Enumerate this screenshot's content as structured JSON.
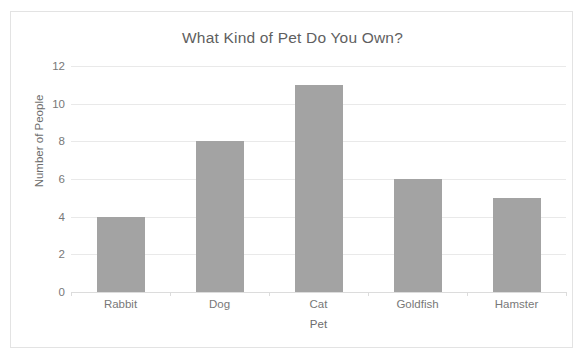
{
  "chart_data": {
    "type": "bar",
    "title": "What Kind of Pet Do You Own?",
    "xlabel": "Pet",
    "ylabel": "Number of People",
    "categories": [
      "Rabbit",
      "Dog",
      "Cat",
      "Goldfish",
      "Hamster"
    ],
    "values": [
      4,
      8,
      11,
      6,
      5
    ],
    "ylim": [
      0,
      12
    ],
    "yticks": [
      0,
      2,
      4,
      6,
      8,
      10,
      12
    ],
    "ytick_labels": [
      "0",
      "2",
      "4",
      "6",
      "8",
      "10",
      "12"
    ],
    "grid": true,
    "legend": false,
    "bar_color": "#a3a3a3",
    "gridline_color": "#e9e9e9",
    "text_color": "#787878",
    "title_color": "#5f5f5f",
    "frame_color": "#e3e3e3",
    "background_color": "#ffffff"
  }
}
